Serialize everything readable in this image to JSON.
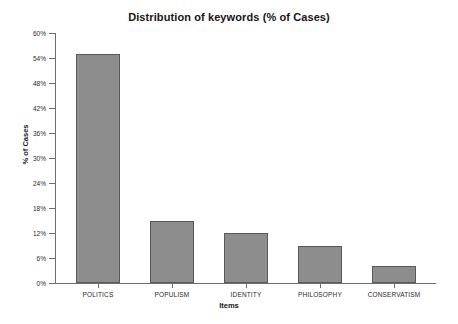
{
  "chart_data": {
    "type": "bar",
    "title": "Distribution of keywords (% of Cases)",
    "xlabel": "Items",
    "ylabel": "% of Cases",
    "categories": [
      "POLITICS",
      "POPULISM",
      "IDENTITY",
      "PHILOSOPHY",
      "CONSERVATISM"
    ],
    "values": [
      55,
      15,
      12,
      9,
      4
    ],
    "ylim": [
      0,
      60
    ],
    "ytick_values": [
      0,
      6,
      12,
      18,
      24,
      30,
      36,
      42,
      48,
      54,
      60
    ],
    "ytick_labels": [
      "0%",
      "6%",
      "12%",
      "18%",
      "24%",
      "30%",
      "36%",
      "42%",
      "48%",
      "54%",
      "60%"
    ],
    "grid": false,
    "legend": null,
    "bar_color": "#8d8d8d",
    "bar_edge_color": "#5a5a5a",
    "axis_color": "#6e6e6e",
    "background": "#ffffff"
  }
}
